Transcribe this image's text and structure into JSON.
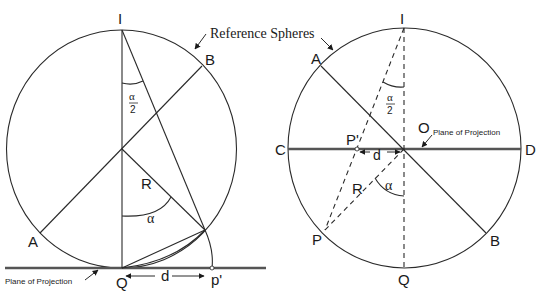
{
  "title_fragment": "",
  "colors": {
    "stroke": "#2a2a2a",
    "plane": "#555555",
    "background": "#ffffff"
  },
  "callout": {
    "reference_spheres": "Reference Spheres"
  },
  "left_diagram": {
    "name": "Stereographic projection (tangent plane)",
    "labels": {
      "I": "I",
      "B": "B",
      "A": "A",
      "Q": "Q",
      "p_prime": "p'",
      "R": "R",
      "alpha": "α",
      "alpha_half_num": "α",
      "alpha_half_den": "2",
      "d": "d"
    },
    "plane_label": "Plane of Projection"
  },
  "right_diagram": {
    "name": "Stereographic projection (equatorial plane)",
    "labels": {
      "I": "I",
      "A": "A",
      "B": "B",
      "C": "C",
      "D": "D",
      "O": "O",
      "P": "P",
      "P_prime": "P'",
      "Q": "Q",
      "R": "R",
      "alpha": "α",
      "alpha_half_num": "α",
      "alpha_half_den": "2",
      "d": "d"
    },
    "plane_label": "Plane of Projection"
  }
}
